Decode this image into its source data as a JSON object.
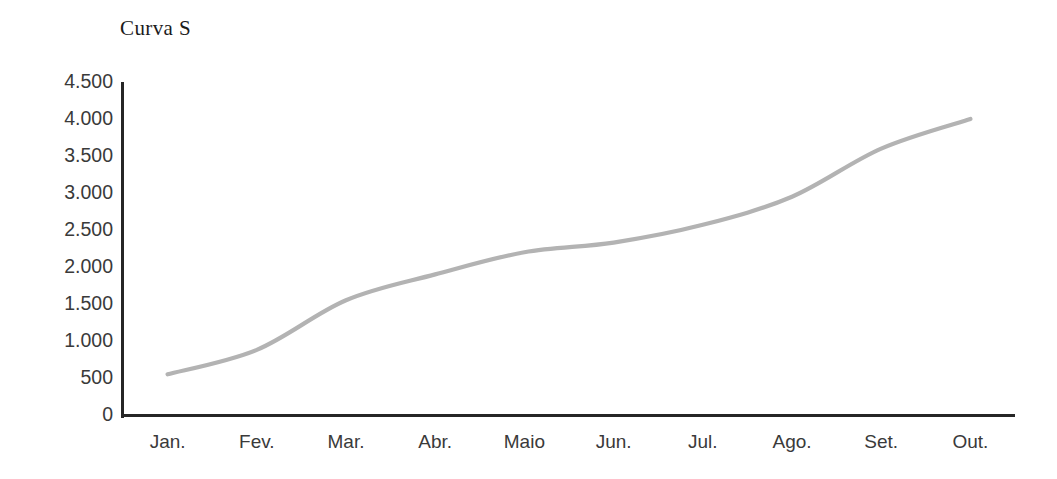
{
  "chart_data": {
    "type": "line",
    "title": "Curva S",
    "xlabel": "",
    "ylabel": "",
    "categories": [
      "Jan.",
      "Fev.",
      "Mar.",
      "Abr.",
      "Maio",
      "Jun.",
      "Jul.",
      "Ago.",
      "Set.",
      "Out."
    ],
    "values": [
      550,
      880,
      1550,
      1900,
      2200,
      2330,
      2570,
      2950,
      3600,
      4000
    ],
    "series": [
      {
        "name": "Curva S",
        "values": [
          550,
          880,
          1550,
          1900,
          2200,
          2330,
          2570,
          2950,
          3600,
          4000
        ],
        "color": "#b3b3b3"
      }
    ],
    "ylim": [
      0,
      4500
    ],
    "ytick_values": [
      4500,
      4000,
      3500,
      3000,
      2500,
      2000,
      1500,
      1000,
      500,
      0
    ],
    "ytick_labels": [
      "4.500",
      "4.000",
      "3.500",
      "3.000",
      "2.500",
      "2.000",
      "1.500",
      "1.000",
      "500",
      "0"
    ],
    "grid": false,
    "legend": false,
    "axis_color": "#262626",
    "label_color": "#3a3a3a"
  }
}
